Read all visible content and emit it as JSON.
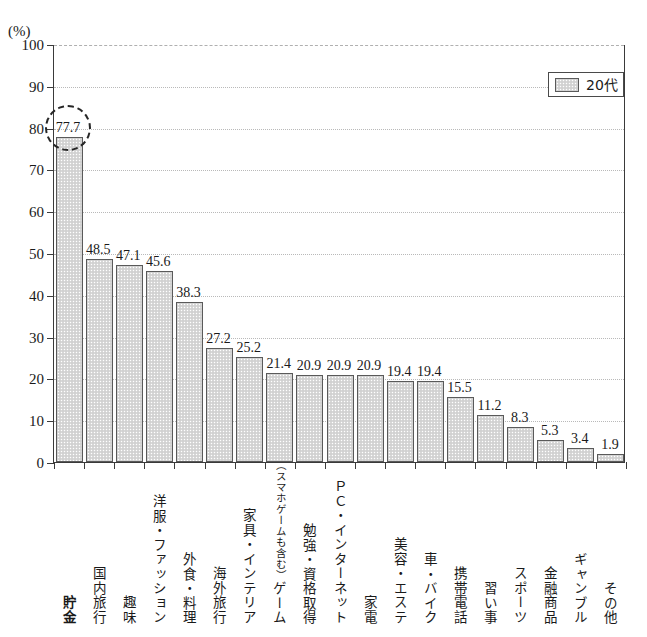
{
  "chart_data": {
    "type": "bar",
    "title": "",
    "subtitle": "",
    "xlabel": "",
    "ylabel": "(%)",
    "unit_label": "(%)",
    "ylim": [
      0,
      100
    ],
    "ytick_step": 10,
    "ytick_labels": [
      "0",
      "10",
      "20",
      "30",
      "40",
      "50",
      "60",
      "70",
      "80",
      "90",
      "100"
    ],
    "grid": true,
    "legend_position": "top-right",
    "legend": [
      "20代"
    ],
    "series": [
      {
        "name": "20代",
        "values": [
          77.7,
          48.5,
          47.1,
          45.6,
          38.3,
          27.2,
          25.2,
          21.4,
          20.9,
          20.9,
          20.9,
          19.4,
          19.4,
          15.5,
          11.2,
          8.3,
          5.3,
          3.4,
          1.9
        ]
      }
    ],
    "categories": [
      "貯金",
      "国内旅行",
      "趣味",
      "洋服・ファッション",
      "外食・料理",
      "海外旅行",
      "家具・インテリア",
      "ゲーム",
      "勉強・資格取得",
      "ＰＣ・インターネット",
      "家電",
      "美容・エステ",
      "車・バイク",
      "携帯電話",
      "習い事",
      "スポーツ",
      "金融商品",
      "ギャンブル",
      "その他"
    ],
    "category_subtexts": [
      "",
      "",
      "",
      "",
      "",
      "",
      "",
      "（スマホゲームも含む）",
      "",
      "",
      "",
      "",
      "",
      "",
      "",
      "",
      "",
      "",
      ""
    ],
    "data_labels": [
      "77.7",
      "48.5",
      "47.1",
      "45.6",
      "38.3",
      "27.2",
      "25.2",
      "21.4",
      "20.9",
      "20.9",
      "20.9",
      "19.4",
      "19.4",
      "15.5",
      "11.2",
      "8.3",
      "5.3",
      "3.4",
      "1.9"
    ],
    "annotations": [
      {
        "type": "dashed-circle",
        "target_category": "貯金",
        "target_value": 77.7,
        "label": "77.7"
      }
    ],
    "emphasized_categories": [
      "貯金"
    ],
    "colors": {
      "bar_fill": "#d8d8d8",
      "bar_border": "#5a5a5a",
      "axis": "#3a3a3a",
      "gridline": "#b9b9b9",
      "text": "#1a1a1a",
      "annotation": "#262626",
      "background": "#ffffff"
    }
  },
  "legend": {
    "series_label": "20代"
  },
  "axis": {
    "unit": "(%)"
  }
}
